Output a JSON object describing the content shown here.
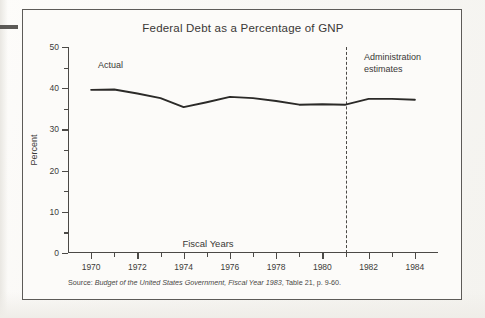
{
  "figure": {
    "title": "Federal Debt as a Percentage of GNP",
    "source_prefix": "Source: ",
    "source_italic": "Budget of the United States Government, Fiscal Year 1983",
    "source_suffix": ", Table 21, p. 9-60.",
    "annotation_actual": "Actual",
    "annotation_estimates": "Administration\nestimates",
    "ink_color": "#2b2a28",
    "frame_color": "#5d5b58",
    "page_color": "#fcfbf9"
  },
  "chart_data": {
    "type": "line",
    "title": "Federal Debt as a Percentage of GNP",
    "xlabel": "Fiscal Years",
    "ylabel": "Percent",
    "xlim": [
      1969,
      1985
    ],
    "ylim": [
      0,
      50
    ],
    "grid": false,
    "legend_position": "none",
    "y_ticks_major": [
      0,
      10,
      20,
      30,
      40,
      50
    ],
    "y_ticks_minor": [
      5,
      15,
      25,
      35,
      45
    ],
    "x_ticks_major": [
      1970,
      1972,
      1974,
      1976,
      1978,
      1980,
      1982,
      1984
    ],
    "x_ticks_minor": [
      1971,
      1973,
      1975,
      1977,
      1979,
      1981,
      1983
    ],
    "x_tick_labels": [
      "1970",
      "1972",
      "1974",
      "1976",
      "1978",
      "1980",
      "1982",
      "1984"
    ],
    "y_tick_labels": [
      "0",
      "10",
      "20",
      "30",
      "40",
      "50"
    ],
    "annotations": [
      {
        "text": "Actual",
        "x": 1971.2,
        "y": 46
      },
      {
        "text": "Administration estimates",
        "x": 1982.2,
        "y": 47
      }
    ],
    "reference_line": {
      "orientation": "vertical",
      "x": 1981,
      "style": "dashed",
      "label": "Actual / estimates divide"
    },
    "x": [
      1970,
      1971,
      1972,
      1973,
      1974,
      1975,
      1976,
      1977,
      1978,
      1979,
      1980,
      1981,
      1982,
      1983,
      1984
    ],
    "series": [
      {
        "name": "Federal debt as percent of GNP",
        "values": [
          39.6,
          39.7,
          38.7,
          37.6,
          35.4,
          36.6,
          37.9,
          37.6,
          36.9,
          36.0,
          36.1,
          36.0,
          37.4,
          37.4,
          37.2
        ]
      }
    ]
  }
}
